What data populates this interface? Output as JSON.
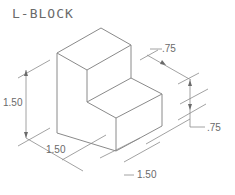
{
  "title": "L-BLOCK",
  "dimensions": {
    "height_left": "1.50",
    "width_front_left": "1.50",
    "width_front_bottom": "1.50",
    "depth_top_right": ".75",
    "height_right": ".75"
  },
  "colors": {
    "line": "#8a8a8a",
    "text": "#6a6a6a",
    "background": "#ffffff"
  }
}
